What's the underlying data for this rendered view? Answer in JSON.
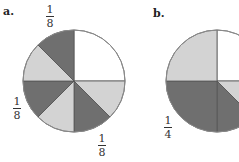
{
  "colors": {
    "dark": "#6f6f6f",
    "light": "#d3d3d3",
    "white": "#ffffff",
    "outline": "#8a8a8a"
  },
  "diagrams": [
    {
      "label": "a.",
      "center": [
        74,
        81
      ],
      "radius": 51,
      "sectors": [
        {
          "start": 0,
          "end": 90,
          "fill": "white"
        },
        {
          "start": 90,
          "end": 135,
          "fill": "light"
        },
        {
          "start": 135,
          "end": 180,
          "fill": "dark"
        },
        {
          "start": 180,
          "end": 225,
          "fill": "light"
        },
        {
          "start": 225,
          "end": 270,
          "fill": "dark"
        },
        {
          "start": 270,
          "end": 315,
          "fill": "light"
        },
        {
          "start": 315,
          "end": 360,
          "fill": "dark"
        }
      ],
      "fractions": [
        {
          "num": "1",
          "den": "8",
          "pos": "top"
        },
        {
          "num": "1",
          "den": "8",
          "pos": "left"
        },
        {
          "num": "1",
          "den": "8",
          "pos": "bottom"
        }
      ]
    },
    {
      "label": "b.",
      "center": [
        217,
        81
      ],
      "radius": 51,
      "sectors": [
        {
          "start": 0,
          "end": 90,
          "fill": "white"
        },
        {
          "start": 90,
          "end": 135,
          "fill": "light"
        },
        {
          "start": 135,
          "end": 180,
          "fill": "dark"
        },
        {
          "start": 180,
          "end": 270,
          "fill": "dark"
        },
        {
          "start": 270,
          "end": 360,
          "fill": "light"
        }
      ],
      "fractions": [
        {
          "num": "1",
          "den": "4",
          "pos": "left"
        }
      ]
    }
  ]
}
